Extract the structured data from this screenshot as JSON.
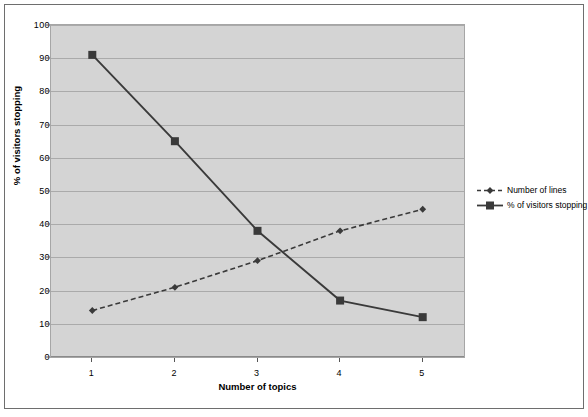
{
  "chart_data": {
    "type": "line",
    "title": "",
    "xlabel": "Number of topics",
    "ylabel": "% of visitors stopping",
    "categories": [
      "1",
      "2",
      "3",
      "4",
      "5"
    ],
    "x": [
      1,
      2,
      3,
      4,
      5
    ],
    "ylim": [
      0,
      100
    ],
    "yticks": [
      0,
      10,
      20,
      30,
      40,
      50,
      60,
      70,
      80,
      90,
      100
    ],
    "ytick_labels": [
      "0",
      "10",
      "20",
      "30",
      "40",
      "50",
      "60",
      "70",
      "80",
      "90",
      "100"
    ],
    "grid": true,
    "legend_position": "right",
    "plot_background": "#d4d4d4",
    "series": [
      {
        "name": "Number of lines",
        "values": [
          14,
          21,
          29,
          38,
          44.5
        ],
        "line_style": "dashed",
        "marker": "diamond",
        "color": "#3a3a3a"
      },
      {
        "name": "% of visitors stopping",
        "values": [
          91,
          65,
          38,
          17,
          12
        ],
        "line_style": "solid",
        "marker": "square",
        "color": "#3a3a3a"
      }
    ]
  },
  "legend": {
    "entries": [
      {
        "label": "Number of lines"
      },
      {
        "label": "% of visitors stopping"
      }
    ]
  }
}
